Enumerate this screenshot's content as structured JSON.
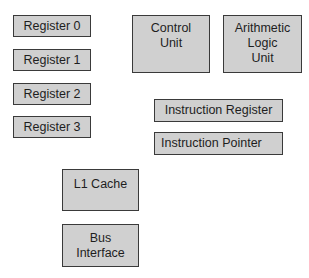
{
  "diagram": {
    "title": "",
    "box_color": "#d0d0d0",
    "border_color": "#3a3a3a",
    "boxes": [
      {
        "id": "register-0",
        "label": "Register 0"
      },
      {
        "id": "register-1",
        "label": "Register 1"
      },
      {
        "id": "register-2",
        "label": "Register 2"
      },
      {
        "id": "register-3",
        "label": "Register 3"
      },
      {
        "id": "control-unit",
        "label": "Control\nUnit"
      },
      {
        "id": "alu",
        "label": "Arithmetic\nLogic\nUnit"
      },
      {
        "id": "instruction-register",
        "label": "Instruction Register"
      },
      {
        "id": "instruction-pointer",
        "label": "Instruction Pointer"
      },
      {
        "id": "l1-cache",
        "label": "L1 Cache"
      },
      {
        "id": "bus-interface",
        "label": "Bus\nInterface"
      }
    ]
  }
}
